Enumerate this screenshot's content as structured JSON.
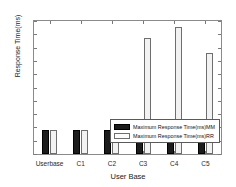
{
  "chart_data": {
    "type": "bar",
    "title": "",
    "xlabel": "User Base",
    "ylabel": "Response Time(ms)",
    "categories": [
      "Userbase",
      "C1",
      "C2",
      "C3",
      "C4",
      "C5"
    ],
    "series": [
      {
        "name": "Maximum Response Time(ms)MM",
        "color": "#1c1c1c",
        "values": [
          181,
          181,
          180,
          210,
          180,
          180
        ]
      },
      {
        "name": "Maximum Response Time(ms)RR",
        "color": "#f2f2f2",
        "values": [
          181,
          183,
          180,
          875,
          955,
          762
        ]
      }
    ],
    "ylim": [
      0,
      1000
    ],
    "yticks": [
      0,
      100,
      200,
      300,
      400,
      500,
      600,
      700,
      800,
      900,
      1000
    ],
    "ytick_labels": [
      "0",
      "100",
      "200",
      "300",
      "400",
      "500",
      "600",
      "700",
      "800",
      "900",
      "1000"
    ],
    "grid": false,
    "legend_position": "lower-center-right",
    "legend": [
      "Maximum Response Time(ms)MM",
      "Maximum Response Time(ms)RR"
    ]
  }
}
